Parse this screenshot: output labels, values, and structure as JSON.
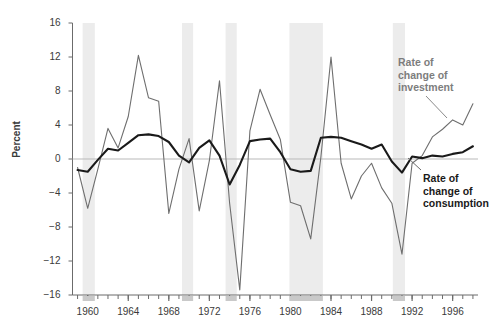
{
  "chart_data": {
    "type": "line",
    "title": "",
    "xlabel": "",
    "ylabel": "Percent",
    "xlim": [
      1958.5,
      1998.5
    ],
    "ylim": [
      -16,
      16
    ],
    "yticks": [
      16,
      12,
      8,
      4,
      0,
      -4,
      -8,
      -12,
      -16
    ],
    "ytick_labels": [
      "16",
      "12",
      "8",
      "4",
      "0",
      "−4",
      "−8",
      "−12",
      "−16"
    ],
    "xticks": [
      1960,
      1964,
      1968,
      1972,
      1976,
      1980,
      1984,
      1988,
      1992,
      1996
    ],
    "xtick_labels": [
      "1960",
      "1964",
      "1968",
      "1972",
      "1976",
      "1980",
      "1984",
      "1988",
      "1992",
      "1996"
    ],
    "xminor_step": 1,
    "grid": false,
    "zero_line": true,
    "legend_position": "inline-annotations",
    "x": [
      1959,
      1960,
      1961,
      1962,
      1963,
      1964,
      1965,
      1966,
      1967,
      1968,
      1969,
      1970,
      1971,
      1972,
      1973,
      1974,
      1975,
      1976,
      1977,
      1978,
      1979,
      1980,
      1981,
      1982,
      1983,
      1984,
      1985,
      1986,
      1987,
      1988,
      1989,
      1990,
      1991,
      1992,
      1993,
      1994,
      1995,
      1996,
      1997,
      1998
    ],
    "series": [
      {
        "name": "Rate of change of investment",
        "color": "#6e6e6e",
        "width": 1.1,
        "values": [
          -1.0,
          -5.8,
          -1.2,
          3.6,
          1.3,
          5.0,
          12.2,
          7.2,
          6.8,
          -6.4,
          -1.2,
          2.4,
          -6.1,
          -0.2,
          9.2,
          -5.2,
          -15.4,
          3.3,
          8.2,
          5.2,
          2.3,
          -5.1,
          -5.5,
          -9.4,
          0.2,
          12.0,
          -0.5,
          -4.7,
          -2.0,
          -0.5,
          -3.4,
          -5.2,
          -11.2,
          -0.5,
          0.4,
          2.6,
          3.5,
          4.6,
          4.0,
          6.5
        ]
      },
      {
        "name": "Rate of change of consumption",
        "color": "#1a1a1a",
        "width": 2.1,
        "values": [
          -1.3,
          -1.5,
          -0.1,
          1.2,
          1.0,
          1.9,
          2.8,
          2.9,
          2.7,
          2.0,
          0.4,
          -0.4,
          1.3,
          2.2,
          0.4,
          -3.0,
          -0.7,
          2.1,
          2.3,
          2.4,
          0.8,
          -1.2,
          -1.5,
          -1.4,
          2.5,
          2.6,
          2.5,
          2.1,
          1.7,
          1.2,
          1.7,
          -0.3,
          -1.6,
          0.3,
          0.1,
          0.4,
          0.3,
          0.6,
          0.8,
          1.5
        ]
      }
    ],
    "recession_bands": [
      {
        "start": 1959.5,
        "end": 1960.7
      },
      {
        "start": 1969.3,
        "end": 1970.4
      },
      {
        "start": 1973.6,
        "end": 1974.7
      },
      {
        "start": 1979.9,
        "end": 1983.2
      },
      {
        "start": 1990.1,
        "end": 1991.3
      }
    ],
    "recession_color": "#ececec",
    "annotations": [
      {
        "id": "investment-label",
        "text_lines": [
          "Rate of",
          "change of",
          "investment"
        ],
        "color": "#7d7d7d"
      },
      {
        "id": "consumption-label",
        "text_lines": [
          "Rate of",
          "change of",
          "consumption"
        ],
        "color": "#1a1a1a"
      }
    ]
  },
  "axis": {
    "ylabel": "Percent"
  },
  "annotations": {
    "investment": {
      "line1": "Rate of",
      "line2": "change of",
      "line3": "investment"
    },
    "consumption": {
      "line1": "Rate of",
      "line2": "change of",
      "line3": "consumption"
    }
  },
  "colors": {
    "investment_line": "#6e6e6e",
    "consumption_line": "#1a1a1a",
    "recession_band": "#ececec",
    "axis": "#6b6b6b",
    "text": "#3a3a3a"
  }
}
